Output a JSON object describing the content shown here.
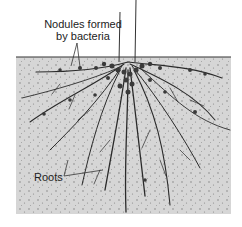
{
  "diagram": {
    "type": "illustration",
    "labels": {
      "nodules_line1": "Nodules formed",
      "nodules_line2": "by bacteria",
      "roots": "Roots"
    },
    "colors": {
      "soil": "#d4d4d4",
      "soil_speckle": "#7a7a7a",
      "root": "#2a2a2a",
      "nodule": "#3a3a3a",
      "background": "#ffffff"
    }
  }
}
